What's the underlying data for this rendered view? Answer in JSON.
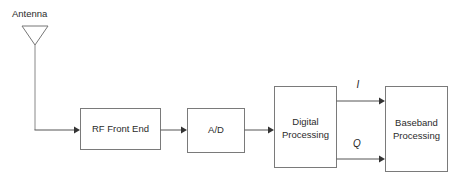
{
  "diagram": {
    "background_color": "#ffffff",
    "line_color": "#555555",
    "box_stroke_color": "#7a7a7a",
    "text_color": "#2b2b2b",
    "antenna": {
      "label": "Antenna",
      "icon": "antenna-triangle-icon"
    },
    "blocks": [
      {
        "id": "rf-front-end",
        "label_line1": "RF Front End",
        "label_line2": ""
      },
      {
        "id": "ad-converter",
        "label_line1": "A/D",
        "label_line2": ""
      },
      {
        "id": "digital-processing",
        "label_line1": "Digital",
        "label_line2": "Processing"
      },
      {
        "id": "baseband-processing",
        "label_line1": "Baseband",
        "label_line2": "Processing"
      }
    ],
    "signals": [
      {
        "id": "i-signal",
        "label": "I"
      },
      {
        "id": "q-signal",
        "label": "Q"
      }
    ]
  }
}
